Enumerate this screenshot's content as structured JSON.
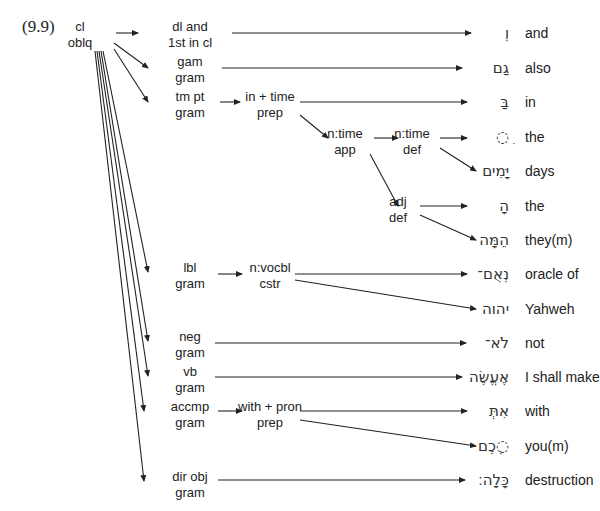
{
  "example_number": "(9.9)",
  "root": {
    "line1": "cl",
    "line2": "oblq"
  },
  "nodes": [
    {
      "id": "dl_and",
      "line1": "dl and",
      "line2": "1st in cl",
      "x": 190,
      "y": 19
    },
    {
      "id": "gam",
      "line1": "gam",
      "line2": "gram",
      "x": 190,
      "y": 54
    },
    {
      "id": "tm_pt",
      "line1": "tm pt",
      "line2": "gram",
      "x": 190,
      "y": 89
    },
    {
      "id": "in_time",
      "line1": "in + time",
      "line2": "prep",
      "x": 270,
      "y": 89
    },
    {
      "id": "ntime_app",
      "line1": "n:time",
      "line2": "app",
      "x": 345,
      "y": 126
    },
    {
      "id": "ntime_def",
      "line1": "n:time",
      "line2": "def",
      "x": 412,
      "y": 126
    },
    {
      "id": "adj_def",
      "line1": "adj",
      "line2": "def",
      "x": 398,
      "y": 194
    },
    {
      "id": "lbl",
      "line1": "lbl",
      "line2": "gram",
      "x": 190,
      "y": 260
    },
    {
      "id": "nvocbl",
      "line1": "n:vocbl",
      "line2": "cstr",
      "x": 270,
      "y": 260
    },
    {
      "id": "neg",
      "line1": "neg",
      "line2": "gram",
      "x": 190,
      "y": 329
    },
    {
      "id": "vb",
      "line1": "vb",
      "line2": "gram",
      "x": 190,
      "y": 364
    },
    {
      "id": "accmp",
      "line1": "accmp",
      "line2": "gram",
      "x": 190,
      "y": 399
    },
    {
      "id": "with_pron",
      "line1": "with + pron",
      "line2": "prep",
      "x": 270,
      "y": 399
    },
    {
      "id": "dir_obj",
      "line1": "dir obj",
      "line2": "gram",
      "x": 190,
      "y": 469
    }
  ],
  "words": [
    {
      "hebrew": "וְ",
      "gloss": "and",
      "y": 33
    },
    {
      "hebrew": "גַם",
      "gloss": "also",
      "y": 68
    },
    {
      "hebrew": "בַּ",
      "gloss": "in",
      "y": 102
    },
    {
      "hebrew": "ִ◌",
      "gloss": "the",
      "y": 137
    },
    {
      "hebrew": "יָּמִים",
      "gloss": "days",
      "y": 171
    },
    {
      "hebrew": "הָ",
      "gloss": "the",
      "y": 206
    },
    {
      "hebrew": "הֵמָּה",
      "gloss": "they(m)",
      "y": 240
    },
    {
      "hebrew": "נְאֻם־",
      "gloss": "oracle of",
      "y": 274
    },
    {
      "hebrew": "יהוה",
      "gloss": "Yahweh",
      "y": 309
    },
    {
      "hebrew": "לֹא־",
      "gloss": "not",
      "y": 343
    },
    {
      "hebrew": "אֶעֱשֶׂה",
      "gloss": "I shall make",
      "y": 377
    },
    {
      "hebrew": "אִתְּ",
      "gloss": "with",
      "y": 411
    },
    {
      "hebrew": "◌ְכֶם",
      "gloss": "you(m)",
      "y": 446
    },
    {
      "hebrew": "כָּלָה׃",
      "gloss": "destruction",
      "y": 480
    }
  ],
  "colors": {
    "line": "#222222",
    "text": "#222222",
    "background": "#ffffff"
  }
}
